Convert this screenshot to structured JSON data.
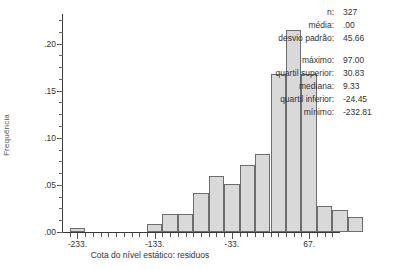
{
  "chart_data": {
    "type": "bar",
    "title": "",
    "xlabel": "Cota do nível estático: residuos",
    "ylabel": "Frequência",
    "xlim": [
      -253,
      107
    ],
    "ylim": [
      0.0,
      0.225
    ],
    "grid": false,
    "legend": "none",
    "x_ticks": [
      {
        "label": "-233.",
        "value": -233
      },
      {
        "label": "-133.",
        "value": -133
      },
      {
        "label": "-33.",
        "value": -33
      },
      {
        "label": "67.",
        "value": 67
      }
    ],
    "y_ticks": [
      {
        "label": ".00",
        "value": 0.0
      },
      {
        "label": ".05",
        "value": 0.05
      },
      {
        "label": ".10",
        "value": 0.1
      },
      {
        "label": ".15",
        "value": 0.15
      },
      {
        "label": ".20",
        "value": 0.2
      }
    ],
    "y_minor_step": 0.0125,
    "bin_width": 20,
    "bars": [
      {
        "x0": -243,
        "x1": -223,
        "value": 0.004
      },
      {
        "x0": -143,
        "x1": -123,
        "value": 0.009
      },
      {
        "x0": -123,
        "x1": -103,
        "value": 0.019
      },
      {
        "x0": -103,
        "x1": -83,
        "value": 0.019
      },
      {
        "x0": -83,
        "x1": -63,
        "value": 0.041
      },
      {
        "x0": -63,
        "x1": -43,
        "value": 0.059
      },
      {
        "x0": -43,
        "x1": -23,
        "value": 0.051
      },
      {
        "x0": -23,
        "x1": -3,
        "value": 0.071
      },
      {
        "x0": -3,
        "x1": 17,
        "value": 0.083
      },
      {
        "x0": 17,
        "x1": 37,
        "value": 0.168
      },
      {
        "x0": 37,
        "x1": 57,
        "value": 0.214
      },
      {
        "x0": 57,
        "x1": 77,
        "value": 0.168
      },
      {
        "x0": 77,
        "x1": 97,
        "value": 0.028
      },
      {
        "x0": 97,
        "x1": 117,
        "value": 0.023
      },
      {
        "x0": 117,
        "x1": 137,
        "value": 0.016
      }
    ],
    "colors": {
      "bar_fill": "#d9d9d9",
      "bar_border": "#6d6d6d",
      "axis": "#3a3a3a",
      "text": "#333333"
    }
  },
  "stats": {
    "rows": [
      {
        "label": "n:",
        "value": "327"
      },
      {
        "label": "média:",
        "value": ".00"
      },
      {
        "label": "desvio padrão:",
        "value": "45.66"
      },
      {
        "label": "máximo:",
        "value": "97.00"
      },
      {
        "label": "quartil superior:",
        "value": "30.83"
      },
      {
        "label": "mediana:",
        "value": "9.33"
      },
      {
        "label": "quartil inferior:",
        "value": "-24.45"
      },
      {
        "label": "mínimo:",
        "value": "-232.81"
      }
    ],
    "gap_after_index": 2
  }
}
